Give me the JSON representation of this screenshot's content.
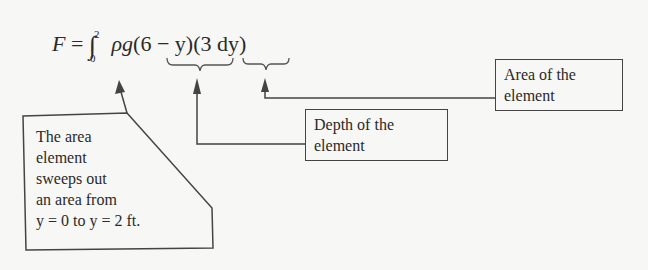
{
  "equation": {
    "lhs": "F",
    "eq": "=",
    "integral": "∫",
    "upper": "2",
    "lower": "0",
    "rho_g": "ρg",
    "depth": "(6 − y)",
    "area": "(3 dy)"
  },
  "labels": {
    "area_element": [
      "Area of the",
      "element"
    ],
    "depth_element": [
      "Depth of the",
      "element"
    ],
    "sweep": [
      "The area",
      "element",
      "sweeps out",
      "an area from",
      "y = 0 to y = 2 ft."
    ]
  }
}
